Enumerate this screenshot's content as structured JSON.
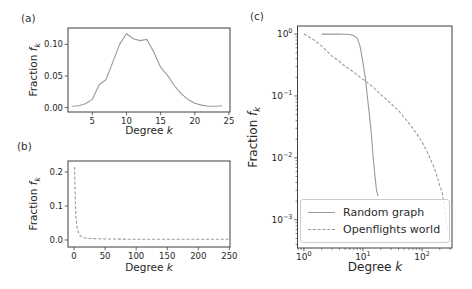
{
  "figure": {
    "background": "#ffffff",
    "curve_color": "#9a9a9a",
    "spine_color": "#3f3f3f",
    "text_color": "#262626",
    "legend_border_color": "#cccccc"
  },
  "panels": {
    "a": {
      "tag": "(a)",
      "xlabel_text": "Degree",
      "xlabel_var": "k",
      "ylabel_text": "Fraction",
      "ylabel_var": "f",
      "ylabel_sub": "k"
    },
    "b": {
      "tag": "(b)",
      "xlabel_text": "Degree",
      "xlabel_var": "k",
      "ylabel_text": "Fraction",
      "ylabel_var": "f",
      "ylabel_sub": "k"
    },
    "c": {
      "tag": "(c)",
      "xlabel_text": "Degree",
      "xlabel_var": "k",
      "ylabel_text": "Fraction",
      "ylabel_var": "f",
      "ylabel_sub": "k",
      "legend": [
        "Random graph",
        "Openflights world"
      ]
    }
  },
  "chart_data": [
    {
      "panel": "a",
      "type": "line",
      "xscale": "linear",
      "yscale": "linear",
      "title": "",
      "xlabel": "Degree k",
      "ylabel": "Fraction f_k",
      "xlim": [
        1.45,
        25.15
      ],
      "ylim": [
        -0.007,
        0.126
      ],
      "xticks": [
        5,
        10,
        15,
        20,
        25
      ],
      "xtick_labels": [
        "5",
        "10",
        "15",
        "20",
        "25"
      ],
      "yticks": [
        0,
        0.05,
        0.1
      ],
      "ytick_labels": [
        "0.00",
        "0.05",
        "0.10"
      ],
      "grid": false,
      "series": [
        {
          "name": "Random graph degree distribution",
          "style": "solid",
          "x": [
            2,
            3,
            4,
            5,
            6,
            7,
            8,
            9,
            10,
            11,
            12,
            13,
            14,
            15,
            16,
            17,
            18,
            19,
            20,
            21,
            22,
            23,
            24
          ],
          "y": [
            0.002,
            0.003,
            0.006,
            0.013,
            0.036,
            0.044,
            0.072,
            0.1,
            0.117,
            0.109,
            0.106,
            0.108,
            0.088,
            0.064,
            0.051,
            0.035,
            0.022,
            0.013,
            0.007,
            0.004,
            0.002,
            0.002,
            0.003
          ]
        }
      ]
    },
    {
      "panel": "b",
      "type": "line",
      "xscale": "linear",
      "yscale": "linear",
      "title": "",
      "xlabel": "Degree k",
      "ylabel": "Fraction f_k",
      "xlim": [
        -9.7,
        251
      ],
      "ylim": [
        -0.0206,
        0.2324
      ],
      "xticks": [
        0,
        50,
        100,
        150,
        200,
        250
      ],
      "xtick_labels": [
        "0",
        "50",
        "100",
        "150",
        "200",
        "250"
      ],
      "yticks": [
        0,
        0.1,
        0.2
      ],
      "ytick_labels": [
        "0.0",
        "0.1",
        "0.2"
      ],
      "grid": false,
      "series": [
        {
          "name": "Openflights world degree distribution",
          "style": "dashed",
          "x": [
            1,
            2,
            3,
            4,
            5,
            6,
            7,
            8,
            10,
            12,
            15,
            20,
            25,
            30,
            40,
            50,
            75,
            100,
            125,
            150,
            175,
            200,
            225,
            250
          ],
          "y": [
            0.215,
            0.113,
            0.072,
            0.052,
            0.038,
            0.028,
            0.022,
            0.018,
            0.013,
            0.01,
            0.007,
            0.005,
            0.0045,
            0.004,
            0.0035,
            0.003,
            0.0025,
            0.002,
            0.002,
            0.002,
            0.002,
            0.002,
            0.002,
            0.002
          ]
        }
      ]
    },
    {
      "panel": "c",
      "type": "line",
      "xscale": "log",
      "yscale": "log",
      "title": "",
      "xlabel": "Degree k",
      "ylabel": "Fraction f_k",
      "xlim": [
        0.78,
        322
      ],
      "ylim": [
        0.00035,
        1.35
      ],
      "xticks": [
        1,
        10,
        100
      ],
      "yticks": [
        1,
        0.1,
        0.01,
        0.001
      ],
      "grid": false,
      "legend_position": "lower left",
      "series": [
        {
          "name": "Random graph",
          "style": "solid",
          "x": [
            2,
            3,
            4,
            5,
            6,
            7,
            8,
            9,
            10,
            11,
            12,
            13,
            14,
            15,
            16,
            17,
            18
          ],
          "y": [
            1.0,
            1.0,
            0.999,
            0.995,
            0.985,
            0.94,
            0.86,
            0.62,
            0.35,
            0.19,
            0.09,
            0.045,
            0.022,
            0.0095,
            0.005,
            0.003,
            0.0024
          ]
        },
        {
          "name": "Openflights world",
          "style": "dashed",
          "x": [
            1,
            1.5,
            2,
            3,
            4,
            5,
            6,
            8,
            10,
            13,
            16,
            20,
            25,
            30,
            40,
            50,
            65,
            80,
            100,
            120,
            140,
            160,
            180,
            200,
            220,
            240,
            260,
            280
          ],
          "y": [
            1.0,
            0.8,
            0.64,
            0.44,
            0.36,
            0.3,
            0.27,
            0.22,
            0.185,
            0.155,
            0.13,
            0.105,
            0.088,
            0.075,
            0.058,
            0.045,
            0.033,
            0.025,
            0.018,
            0.013,
            0.0095,
            0.007,
            0.005,
            0.0035,
            0.0028,
            0.0015,
            0.0009,
            0.0006
          ]
        }
      ]
    }
  ]
}
